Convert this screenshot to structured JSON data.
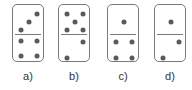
{
  "figure": {
    "pip_color": "#5a5a5a",
    "border_color": "#7a7a7a",
    "dominoes": [
      {
        "label": "a)",
        "left": 12,
        "top_value": 3,
        "bottom_value": 4,
        "top_pips": [
          [
            24,
            9
          ],
          [
            16,
            17
          ],
          [
            8,
            25
          ]
        ],
        "bottom_pips": [
          [
            8,
            36
          ],
          [
            24,
            36
          ],
          [
            8,
            51
          ],
          [
            24,
            51
          ]
        ]
      },
      {
        "label": "b)",
        "left": 58,
        "top_value": 5,
        "bottom_value": 2,
        "top_pips": [
          [
            8,
            9
          ],
          [
            24,
            9
          ],
          [
            16,
            17
          ],
          [
            8,
            25
          ],
          [
            24,
            25
          ]
        ],
        "bottom_pips": [
          [
            24,
            37
          ],
          [
            8,
            53
          ]
        ]
      },
      {
        "label": "c)",
        "left": 107,
        "top_value": 1,
        "bottom_value": 4,
        "top_pips": [
          [
            16,
            17
          ]
        ],
        "bottom_pips": [
          [
            8,
            37
          ],
          [
            24,
            37
          ],
          [
            8,
            53
          ],
          [
            24,
            53
          ]
        ]
      },
      {
        "label": "d)",
        "left": 154,
        "top_value": 1,
        "bottom_value": 2,
        "top_pips": [
          [
            16,
            17
          ]
        ],
        "bottom_pips": [
          [
            24,
            37
          ],
          [
            8,
            53
          ]
        ]
      }
    ]
  }
}
